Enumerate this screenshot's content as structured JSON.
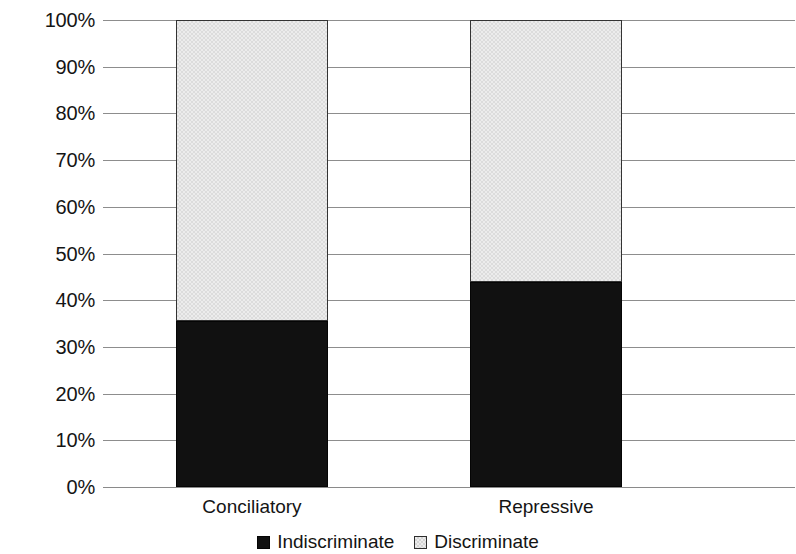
{
  "chart_data": {
    "type": "bar",
    "subtype": "stacked-100-percent",
    "title": "",
    "subtitle": "",
    "xlabel": "",
    "ylabel": "",
    "categories": [
      "Conciliatory",
      "Repressive"
    ],
    "series": [
      {
        "name": "Indiscriminate",
        "values": [
          35.5,
          44.0
        ],
        "color": "#111111",
        "legend_swatch": "filled-black-square"
      },
      {
        "name": "Discriminate",
        "values": [
          64.5,
          56.0
        ],
        "color": "#ececec",
        "legend_swatch": "light-dithered-square"
      }
    ],
    "ylim": [
      0,
      100
    ],
    "ytick_labels": [
      "100%",
      "90%",
      "80%",
      "70%",
      "60%",
      "50%",
      "40%",
      "30%",
      "20%",
      "10%",
      "0%"
    ],
    "ytick_values": [
      100,
      90,
      80,
      70,
      60,
      50,
      40,
      30,
      20,
      10,
      0
    ],
    "grid": true,
    "grid_axis": "y",
    "legend_position": "bottom-center",
    "stack_order": [
      "Indiscriminate",
      "Discriminate"
    ],
    "annotations": []
  },
  "axis": {
    "y_ticks": [
      {
        "label": "100%",
        "value": 100
      },
      {
        "label": "90%",
        "value": 90
      },
      {
        "label": "80%",
        "value": 80
      },
      {
        "label": "70%",
        "value": 70
      },
      {
        "label": "60%",
        "value": 60
      },
      {
        "label": "50%",
        "value": 50
      },
      {
        "label": "40%",
        "value": 40
      },
      {
        "label": "30%",
        "value": 30
      },
      {
        "label": "20%",
        "value": 20
      },
      {
        "label": "10%",
        "value": 10
      },
      {
        "label": "0%",
        "value": 0
      }
    ],
    "x_categories": [
      {
        "label": "Conciliatory"
      },
      {
        "label": "Repressive"
      }
    ]
  },
  "legend": {
    "items": [
      {
        "label": "Indiscriminate",
        "swatch": "dark"
      },
      {
        "label": "Discriminate",
        "swatch": "light"
      }
    ]
  }
}
